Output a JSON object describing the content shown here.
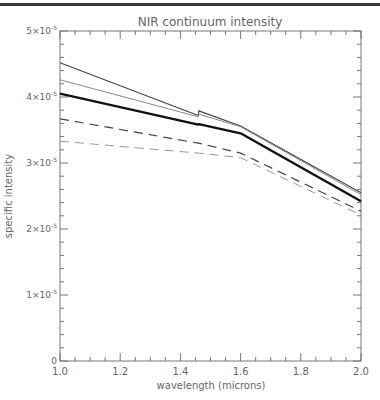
{
  "chart_data": {
    "type": "line",
    "title": "NIR continuum intensity",
    "xlabel": "wavelength (microns)",
    "ylabel": "specific intensity",
    "xlim": [
      1.0,
      2.0
    ],
    "ylim": [
      0,
      5e-05
    ],
    "x_ticks": [
      "1.0",
      "1.2",
      "1.4",
      "1.6",
      "1.8",
      "2.0"
    ],
    "y_ticks": [
      "0",
      "1×10⁻⁵",
      "2×10⁻⁵",
      "3×10⁻⁵",
      "4×10⁻⁵",
      "5×10⁻⁵"
    ],
    "grid": false,
    "legend": null,
    "x": [
      1.0,
      1.459,
      1.461,
      1.6,
      2.0
    ],
    "series": [
      {
        "name": "solid-dark-thin",
        "style": "solid",
        "width": 1.2,
        "color": "#444444",
        "values": [
          4.52e-05,
          3.72e-05,
          3.79e-05,
          3.56e-05,
          2.55e-05
        ]
      },
      {
        "name": "solid-gray-thin",
        "style": "solid",
        "width": 1.0,
        "color": "#888888",
        "values": [
          4.26e-05,
          3.7e-05,
          3.74e-05,
          3.55e-05,
          2.52e-05
        ]
      },
      {
        "name": "solid-thick",
        "style": "solid",
        "width": 2.4,
        "color": "#111111",
        "values": [
          4.05e-05,
          3.58e-05,
          3.59e-05,
          3.45e-05,
          2.42e-05
        ]
      },
      {
        "name": "dashed-dark",
        "style": "dashed",
        "width": 1.2,
        "color": "#444444",
        "values": [
          3.67e-05,
          3.3e-05,
          3.3e-05,
          3.15e-05,
          2.27e-05
        ]
      },
      {
        "name": "dashed-gray",
        "style": "dashed",
        "width": 1.0,
        "color": "#999999",
        "values": [
          3.33e-05,
          3.15e-05,
          3.15e-05,
          3.08e-05,
          2.21e-05
        ]
      }
    ]
  }
}
